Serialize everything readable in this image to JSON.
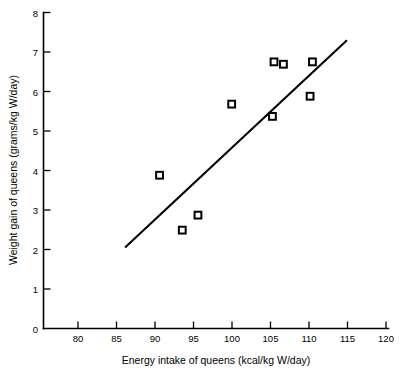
{
  "chart_data": {
    "type": "scatter",
    "title": "",
    "xlabel": "Energy intake of queens (kcal/kg W/day)",
    "ylabel": "Weight gain of queens (grams/kg W/day)",
    "xlim": [
      76,
      120
    ],
    "ylim": [
      0,
      8
    ],
    "xticks": [
      80,
      85,
      90,
      95,
      100,
      105,
      110,
      115,
      120
    ],
    "yticks": [
      0,
      1,
      2,
      3,
      4,
      5,
      6,
      7,
      8
    ],
    "xtick_labels": [
      "80",
      "85",
      "90",
      "95",
      "100",
      "105",
      "110",
      "115",
      "120"
    ],
    "ytick_labels": [
      "0",
      "1",
      "2",
      "3",
      "4",
      "5",
      "6",
      "7",
      "8"
    ],
    "grid": false,
    "legend": null,
    "marker": "open-square",
    "marker_color": "#000000",
    "series": [
      {
        "name": "Queens",
        "x": [
          90.8,
          93.7,
          95.7,
          100.0,
          105.2,
          105.4,
          106.6,
          110.0,
          110.3
        ],
        "y": [
          3.88,
          2.49,
          2.87,
          5.68,
          5.37,
          6.75,
          6.69,
          5.88,
          6.75
        ]
      }
    ],
    "trendline": {
      "type": "linear",
      "x_start": 86.4,
      "y_start": 2.05,
      "x_end": 114.7,
      "y_end": 7.3,
      "color": "#000000"
    }
  },
  "axes": {
    "x_axis_label": "Energy intake of queens (kcal/kg W/day)",
    "y_axis_label": "Weight gain of queens (grams/kg W/day)"
  }
}
